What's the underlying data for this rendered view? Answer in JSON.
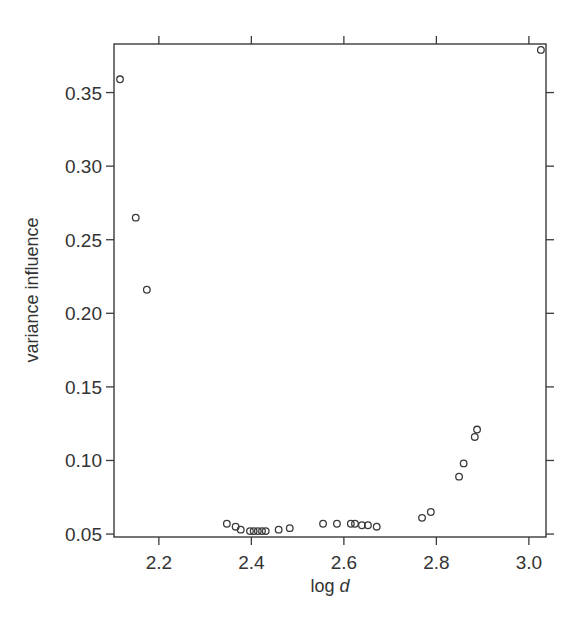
{
  "chart_data": {
    "type": "scatter",
    "title": "",
    "xlabel": "log d",
    "xlabel_parts": {
      "prefix": "log ",
      "italic": "d"
    },
    "ylabel": "variance influence",
    "xlim": [
      2.103,
      3.037
    ],
    "ylim": [
      0.048,
      0.383
    ],
    "xticks": [
      2.2,
      2.4,
      2.6,
      2.8,
      3.0
    ],
    "xtick_labels": [
      "2.2",
      "2.4",
      "2.6",
      "2.8",
      "3.0"
    ],
    "yticks": [
      0.05,
      0.1,
      0.15,
      0.2,
      0.25,
      0.3,
      0.35
    ],
    "ytick_labels": [
      "0.05",
      "0.10",
      "0.15",
      "0.20",
      "0.25",
      "0.30",
      "0.35"
    ],
    "grid": false,
    "legend": null,
    "marker": "open-circle",
    "series": [
      {
        "name": "variance influence",
        "x": [
          2.116,
          2.15,
          2.174,
          2.347,
          2.366,
          2.377,
          2.397,
          2.405,
          2.414,
          2.423,
          2.431,
          2.459,
          2.483,
          2.555,
          2.585,
          2.615,
          2.624,
          2.639,
          2.652,
          2.671,
          2.769,
          2.788,
          2.849,
          2.859,
          2.883,
          2.888,
          3.026
        ],
        "y": [
          0.359,
          0.265,
          0.216,
          0.057,
          0.055,
          0.053,
          0.052,
          0.052,
          0.052,
          0.052,
          0.052,
          0.053,
          0.054,
          0.057,
          0.057,
          0.057,
          0.057,
          0.056,
          0.056,
          0.055,
          0.061,
          0.065,
          0.089,
          0.098,
          0.116,
          0.121,
          0.379
        ]
      }
    ]
  },
  "layout": {
    "plot_left": 114,
    "plot_right": 546,
    "plot_top": 44,
    "plot_bottom": 537,
    "colors": {
      "axis": "#3a3a3a",
      "text": "#333333",
      "background": "#ffffff"
    }
  }
}
